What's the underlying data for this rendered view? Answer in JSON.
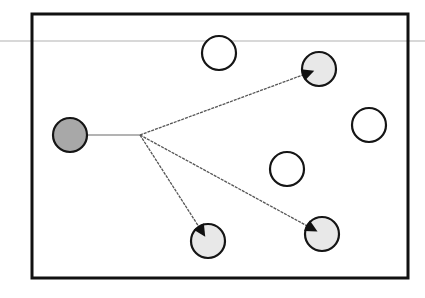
{
  "diagram": {
    "type": "node-graph",
    "colors": {
      "frame": "#111111",
      "background_line": "#d8d8d8",
      "source_fill": "#a8a8a8",
      "target_fill": "#e8e8e8",
      "neutral_fill": "#ffffff",
      "node_stroke": "#151515",
      "edge": "#555555",
      "edge_light": "#9a9a9a"
    },
    "frame": {
      "x": 32,
      "y": 14,
      "width": 376,
      "height": 264
    },
    "background_line": {
      "y": 41
    },
    "node_radius": 17,
    "source": {
      "id": "source",
      "cx": 70,
      "cy": 135,
      "role": "source"
    },
    "branch_point": {
      "x": 140,
      "y": 135
    },
    "targets": [
      {
        "id": "target-top-right",
        "cx": 319,
        "cy": 69,
        "role": "target"
      },
      {
        "id": "target-bottom-left",
        "cx": 208,
        "cy": 241,
        "role": "target"
      },
      {
        "id": "target-bottom-right",
        "cx": 322,
        "cy": 234,
        "role": "target"
      }
    ],
    "neutral_nodes": [
      {
        "id": "node-top",
        "cx": 219,
        "cy": 53,
        "role": "neutral"
      },
      {
        "id": "node-right",
        "cx": 369,
        "cy": 125,
        "role": "neutral"
      },
      {
        "id": "node-middle",
        "cx": 287,
        "cy": 169,
        "role": "neutral"
      }
    ]
  }
}
